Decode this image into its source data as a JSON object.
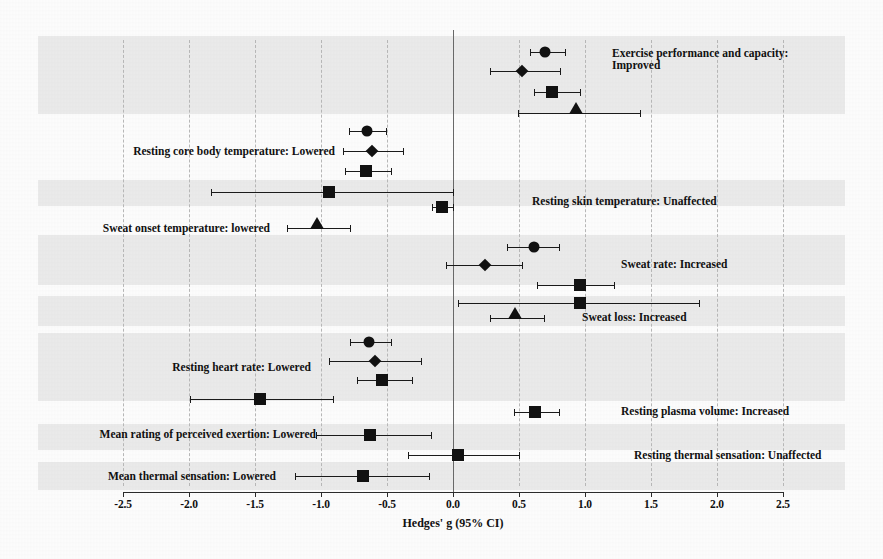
{
  "chart_data": {
    "type": "forest",
    "title": "",
    "xlabel": "Hedges' g (95% CI)",
    "ylabel": "",
    "xlim": [
      -2.5,
      2.5
    ],
    "xticks": [
      -2.5,
      -2.0,
      -1.5,
      -1.0,
      -0.5,
      0.0,
      0.5,
      1.0,
      1.5,
      2.0,
      2.5
    ],
    "xtick_labels": [
      "-2.5",
      "-2.0",
      "-1.5",
      "-1.0",
      "-0.5",
      "0.0",
      "0.5",
      "1.0",
      "1.5",
      "2.0",
      "2.5"
    ],
    "grid": "vertical dashed gridlines at every tick; solid reference line at 0.0",
    "legend": "none",
    "marker_shapes": [
      "circle",
      "diamond",
      "square",
      "triangle"
    ],
    "groups": [
      {
        "label": "Exercise performance  and capacity:",
        "label_line2": "Improved",
        "label_side": "right",
        "rows": [
          {
            "shape": "circle",
            "g": 0.7,
            "ci_low": 0.58,
            "ci_high": 0.85
          },
          {
            "shape": "diamond",
            "g": 0.52,
            "ci_low": 0.28,
            "ci_high": 0.81
          },
          {
            "shape": "square",
            "g": 0.75,
            "ci_low": 0.61,
            "ci_high": 0.96
          },
          {
            "shape": "triangle",
            "g": 0.93,
            "ci_low": 0.49,
            "ci_high": 1.42
          }
        ]
      },
      {
        "label": "Resting core body temperature:  Lowered",
        "label_line2": "",
        "label_side": "left",
        "rows": [
          {
            "shape": "circle",
            "g": -0.65,
            "ci_low": -0.79,
            "ci_high": -0.51
          },
          {
            "shape": "diamond",
            "g": -0.61,
            "ci_low": -0.83,
            "ci_high": -0.38
          },
          {
            "shape": "square",
            "g": -0.66,
            "ci_low": -0.82,
            "ci_high": -0.47
          },
          {
            "shape": "square",
            "g": -0.94,
            "ci_low": -1.83,
            "ci_high": 0.0
          }
        ]
      },
      {
        "label": "Resting skin temperature:  Unaffected",
        "label_line2": "",
        "label_side": "right",
        "rows": [
          {
            "shape": "square",
            "g": -0.08,
            "ci_low": -0.16,
            "ci_high": 0.0
          }
        ]
      },
      {
        "label": "Sweat onset temperature: lowered",
        "label_line2": "",
        "label_side": "left",
        "rows": [
          {
            "shape": "triangle",
            "g": -1.03,
            "ci_low": -1.26,
            "ci_high": -0.78
          }
        ]
      },
      {
        "label": "Sweat rate: Increased",
        "label_line2": "",
        "label_side": "right",
        "rows": [
          {
            "shape": "circle",
            "g": 0.61,
            "ci_low": 0.41,
            "ci_high": 0.8
          },
          {
            "shape": "diamond",
            "g": 0.24,
            "ci_low": -0.05,
            "ci_high": 0.52
          },
          {
            "shape": "square",
            "g": 0.96,
            "ci_low": 0.64,
            "ci_high": 1.22
          },
          {
            "shape": "square",
            "g": 0.96,
            "ci_low": 0.04,
            "ci_high": 1.86
          }
        ]
      },
      {
        "label": "Sweat loss: Increased",
        "label_line2": "",
        "label_side": "right",
        "rows": [
          {
            "shape": "triangle",
            "g": 0.47,
            "ci_low": 0.28,
            "ci_high": 0.69
          }
        ]
      },
      {
        "label": "Resting heart rate: Lowered",
        "label_line2": "",
        "label_side": "left",
        "rows": [
          {
            "shape": "circle",
            "g": -0.64,
            "ci_low": -0.78,
            "ci_high": -0.47
          },
          {
            "shape": "diamond",
            "g": -0.59,
            "ci_low": -0.94,
            "ci_high": -0.24
          },
          {
            "shape": "square",
            "g": -0.54,
            "ci_low": -0.73,
            "ci_high": -0.31
          },
          {
            "shape": "square",
            "g": -1.46,
            "ci_low": -1.99,
            "ci_high": -0.91
          }
        ]
      },
      {
        "label": "Resting plasma volume:  Increased",
        "label_line2": "",
        "label_side": "right",
        "rows": [
          {
            "shape": "square",
            "g": 0.62,
            "ci_low": 0.46,
            "ci_high": 0.8
          }
        ]
      },
      {
        "label": "Mean rating of perceived exertion: Lowered",
        "label_line2": "",
        "label_side": "left",
        "rows": [
          {
            "shape": "square",
            "g": -0.63,
            "ci_low": -1.04,
            "ci_high": -0.17
          }
        ]
      },
      {
        "label": "Resting thermal  sensation: Unaffected",
        "label_line2": "",
        "label_side": "right",
        "rows": [
          {
            "shape": "square",
            "g": 0.04,
            "ci_low": -0.34,
            "ci_high": 0.5
          }
        ]
      },
      {
        "label": "Mean thermal sensation: Lowered",
        "label_line2": "",
        "label_side": "left",
        "rows": [
          {
            "shape": "square",
            "g": -0.68,
            "ci_low": -1.2,
            "ci_high": -0.18
          }
        ]
      }
    ]
  },
  "layout": {
    "rows": [
      {
        "y": 52,
        "group": 0,
        "idx": 0
      },
      {
        "y": 71,
        "group": 0,
        "idx": 1
      },
      {
        "y": 92,
        "group": 0,
        "idx": 2
      },
      {
        "y": 113,
        "group": 0,
        "idx": 3
      },
      {
        "y": 131,
        "group": 1,
        "idx": 0
      },
      {
        "y": 151,
        "group": 1,
        "idx": 1
      },
      {
        "y": 171,
        "group": 1,
        "idx": 2
      },
      {
        "y": 192,
        "group": 1,
        "idx": 3
      },
      {
        "y": 207,
        "group": 2,
        "idx": 0
      },
      {
        "y": 228,
        "group": 3,
        "idx": 0
      },
      {
        "y": 247,
        "group": 4,
        "idx": 0
      },
      {
        "y": 265,
        "group": 4,
        "idx": 1
      },
      {
        "y": 285,
        "group": 4,
        "idx": 2
      },
      {
        "y": 303,
        "group": 4,
        "idx": 3
      },
      {
        "y": 318,
        "group": 5,
        "idx": 0
      },
      {
        "y": 342,
        "group": 6,
        "idx": 0
      },
      {
        "y": 361,
        "group": 6,
        "idx": 1
      },
      {
        "y": 380,
        "group": 6,
        "idx": 2
      },
      {
        "y": 399,
        "group": 6,
        "idx": 3
      },
      {
        "y": 412,
        "group": 7,
        "idx": 0
      },
      {
        "y": 435,
        "group": 8,
        "idx": 0
      },
      {
        "y": 455,
        "group": 9,
        "idx": 0
      },
      {
        "y": 476,
        "group": 10,
        "idx": 0
      }
    ],
    "bands": [
      {
        "top": 36,
        "height": 78
      },
      {
        "top": 180,
        "height": 26
      },
      {
        "top": 235,
        "height": 50
      },
      {
        "top": 296,
        "height": 30
      },
      {
        "top": 333,
        "height": 68
      },
      {
        "top": 424,
        "height": 26
      },
      {
        "top": 462,
        "height": 28
      }
    ],
    "group_labels": [
      {
        "group": 0,
        "x": 612,
        "y": 47,
        "side": "right"
      },
      {
        "group": 1,
        "x": 335,
        "y": 145,
        "side": "left"
      },
      {
        "group": 2,
        "x": 532,
        "y": 195,
        "side": "right"
      },
      {
        "group": 3,
        "x": 270,
        "y": 222,
        "side": "left"
      },
      {
        "group": 4,
        "x": 621,
        "y": 258,
        "side": "right"
      },
      {
        "group": 5,
        "x": 582,
        "y": 311,
        "side": "right"
      },
      {
        "group": 6,
        "x": 311,
        "y": 361,
        "side": "left"
      },
      {
        "group": 7,
        "x": 621,
        "y": 405,
        "side": "right"
      },
      {
        "group": 8,
        "x": 316,
        "y": 428,
        "side": "left"
      },
      {
        "group": 9,
        "x": 634,
        "y": 449,
        "side": "right"
      },
      {
        "group": 10,
        "x": 276,
        "y": 470,
        "side": "left"
      }
    ],
    "x0_px": 453,
    "px_per_unit": 132
  }
}
